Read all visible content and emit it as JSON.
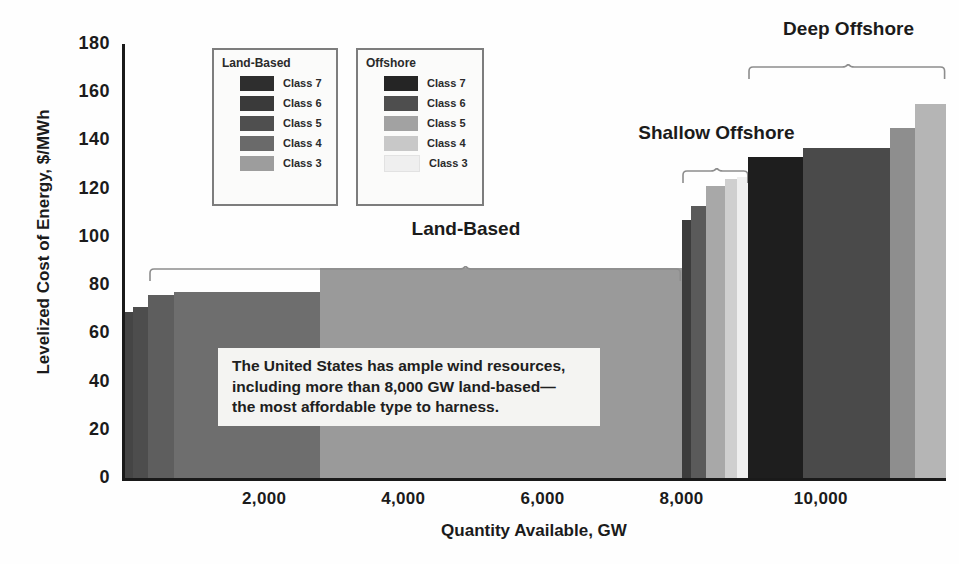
{
  "chart_data": {
    "type": "bar",
    "title": "",
    "xlabel": "Quantity Available, GW",
    "ylabel": "Levelized Cost of Energy, $/MWh",
    "xlim": [
      0,
      11800
    ],
    "ylim": [
      0,
      180
    ],
    "xticks": [
      "2,000",
      "4,000",
      "6,000",
      "8,000",
      "10,000"
    ],
    "xtick_values": [
      2000,
      4000,
      6000,
      8000,
      10000
    ],
    "yticks": [
      "0",
      "20",
      "40",
      "60",
      "80",
      "100",
      "120",
      "140",
      "160",
      "180"
    ],
    "ytick_values": [
      0,
      20,
      40,
      60,
      80,
      100,
      120,
      140,
      160,
      180
    ],
    "grid": false,
    "legend_position": "top-center",
    "note": "Variable-width stepped bars: width = quantity available (GW), height = levelized cost of energy ($/MWh)",
    "groups": [
      {
        "name": "Land-Based",
        "bars": [
          {
            "label": "Class 7",
            "x_start": 0,
            "x_end": 120,
            "width_gw": 120,
            "value": 69,
            "color": "#454545"
          },
          {
            "label": "Class 6",
            "x_start": 120,
            "x_end": 330,
            "width_gw": 210,
            "value": 71,
            "color": "#4d4d4d"
          },
          {
            "label": "Class 5",
            "x_start": 330,
            "x_end": 700,
            "width_gw": 370,
            "value": 76,
            "color": "#5e5e5e"
          },
          {
            "label": "Class 4",
            "x_start": 700,
            "x_end": 2800,
            "width_gw": 2100,
            "value": 77,
            "color": "#6e6e6e"
          },
          {
            "label": "Class 3",
            "x_start": 2800,
            "x_end": 8000,
            "width_gw": 5200,
            "value": 87,
            "color": "#9a9a9a"
          }
        ]
      },
      {
        "name": "Shallow Offshore",
        "bars": [
          {
            "label": "Class 7",
            "x_start": 8000,
            "x_end": 8140,
            "width_gw": 140,
            "value": 107,
            "color": "#3c3c3c"
          },
          {
            "label": "Class 6",
            "x_start": 8140,
            "x_end": 8350,
            "width_gw": 210,
            "value": 113,
            "color": "#5a5a5a"
          },
          {
            "label": "Class 5",
            "x_start": 8350,
            "x_end": 8620,
            "width_gw": 270,
            "value": 121,
            "color": "#a8a8a8"
          },
          {
            "label": "Class 4",
            "x_start": 8620,
            "x_end": 8790,
            "width_gw": 170,
            "value": 124,
            "color": "#cfcfcf"
          },
          {
            "label": "Class 3",
            "x_start": 8790,
            "x_end": 8960,
            "width_gw": 170,
            "value": 125,
            "color": "#efefef"
          }
        ]
      },
      {
        "name": "Deep Offshore",
        "bars": [
          {
            "label": "Class 7",
            "x_start": 8960,
            "x_end": 9750,
            "width_gw": 790,
            "value": 133,
            "color": "#1e1e1e"
          },
          {
            "label": "Class 6",
            "x_start": 9750,
            "x_end": 11000,
            "width_gw": 1250,
            "value": 137,
            "color": "#4a4a4a"
          },
          {
            "label": "Class 5",
            "x_start": 11000,
            "x_end": 11350,
            "width_gw": 350,
            "value": 145,
            "color": "#8e8e8e"
          },
          {
            "label": "Class 4",
            "x_start": 11350,
            "x_end": 11800,
            "width_gw": 450,
            "value": 155,
            "color": "#b5b5b5"
          }
        ]
      }
    ],
    "annotations": [
      {
        "name": "Land-Based",
        "x_center": 4900,
        "span": [
          350,
          8000
        ]
      },
      {
        "name": "Shallow Offshore",
        "x_center": 8500,
        "span": [
          8000,
          8960
        ]
      },
      {
        "name": "Deep Offshore",
        "x_center": 10400,
        "span": [
          8960,
          11800
        ]
      }
    ]
  },
  "legends": {
    "land": {
      "title": "Land-Based",
      "items": [
        {
          "label": "Class 7",
          "color": "#2e2e2e"
        },
        {
          "label": "Class 6",
          "color": "#3a3a3a"
        },
        {
          "label": "Class 5",
          "color": "#4f4f4f"
        },
        {
          "label": "Class 4",
          "color": "#6a6a6a"
        },
        {
          "label": "Class 3",
          "color": "#9d9d9d"
        }
      ]
    },
    "offshore": {
      "title": "Offshore",
      "items": [
        {
          "label": "Class 7",
          "color": "#252525"
        },
        {
          "label": "Class 6",
          "color": "#4e4e4e"
        },
        {
          "label": "Class 5",
          "color": "#a2a2a2"
        },
        {
          "label": "Class 4",
          "color": "#c8c8c8"
        },
        {
          "label": "Class 3",
          "color": "#efefef"
        }
      ]
    }
  },
  "callout": {
    "line1": "The United States has ample wind resources,",
    "line2": "including more than 8,000 GW land-based—",
    "line3": "the most affordable type to harness."
  },
  "brackets": {
    "land_based": "Land-Based",
    "shallow_offshore": "Shallow Offshore",
    "deep_offshore": "Deep Offshore"
  }
}
